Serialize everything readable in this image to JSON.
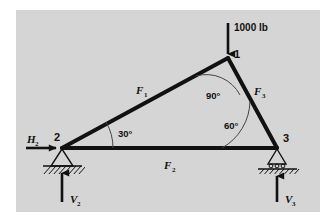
{
  "figure": {
    "kind": "statics-truss-free-body-diagram",
    "panel_background": "#d5d5d5",
    "panel_border": "#ffffff",
    "line_color": "#111111",
    "thin_line_color": "#555555"
  },
  "loads": {
    "applied_load_label": "1000 lb"
  },
  "joints": [
    {
      "id": "joint-1",
      "label": "1",
      "x": 228,
      "y": 58,
      "support": "none"
    },
    {
      "id": "joint-2",
      "label": "2",
      "x": 62,
      "y": 148,
      "support": "pin"
    },
    {
      "id": "joint-3",
      "label": "3",
      "x": 277,
      "y": 148,
      "support": "roller"
    }
  ],
  "members": [
    {
      "id": "member-f1",
      "label": "F",
      "sub": "1",
      "from": "joint-2",
      "to": "joint-1"
    },
    {
      "id": "member-f2",
      "label": "F",
      "sub": "2",
      "from": "joint-2",
      "to": "joint-3"
    },
    {
      "id": "member-f3",
      "label": "F",
      "sub": "3",
      "from": "joint-1",
      "to": "joint-3"
    }
  ],
  "angles": [
    {
      "id": "angle-at-joint-1",
      "value": "90°",
      "at": "joint-1"
    },
    {
      "id": "angle-at-joint-2",
      "value": "30°",
      "at": "joint-2"
    },
    {
      "id": "angle-at-joint-3",
      "value": "60°",
      "at": "joint-3"
    }
  ],
  "reactions": [
    {
      "id": "reaction-h2",
      "label": "H",
      "sub": "2",
      "direction": "right",
      "at": "joint-2"
    },
    {
      "id": "reaction-v2",
      "label": "V",
      "sub": "2",
      "direction": "up",
      "at": "joint-2"
    },
    {
      "id": "reaction-v3",
      "label": "V",
      "sub": "3",
      "direction": "up",
      "at": "joint-3"
    }
  ]
}
